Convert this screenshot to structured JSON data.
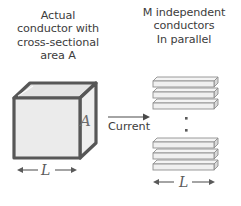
{
  "figure": {
    "title_left": "Actual\nconductor with\ncross-sectional\narea A",
    "title_right": "M independent\nconductors\nIn parallel",
    "labels": {
      "area": "A",
      "current": "Current",
      "length_left": "L",
      "length_right": "L"
    },
    "colors": {
      "background": "#ffffff",
      "cube_front_face": "#ebebeb",
      "cube_top_face": "#e2e2e2",
      "cube_right_face": "#efefef",
      "cube_edge": "#575757",
      "bar_fill": "#f0f0f0",
      "bar_edge": "#8a8a8a",
      "text": "#3c3c3c",
      "label_gray": "#6d6d6d"
    },
    "icons": {
      "current_arrow": "arrow-right-icon",
      "dimension_arrow_left": "arrow-left-icon",
      "dimension_arrow_right": "arrow-right-icon",
      "vertical_ellipsis": "vertical-ellipsis-icon"
    },
    "cube": {
      "description": "isometric-cube",
      "face_count": 3
    },
    "conductor_bars": {
      "top_group_count": 3,
      "bottom_group_count": 3,
      "ellipsis_dots": 2
    }
  }
}
